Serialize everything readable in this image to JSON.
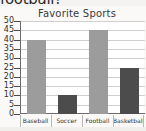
{
  "page": {
    "cut_off_text_above": "football?"
  },
  "chart_data": {
    "type": "bar",
    "title": "Favorite Sports",
    "xlabel": "",
    "ylabel": "",
    "categories": [
      "Baseball",
      "Soccer",
      "Football",
      "Basketball"
    ],
    "values": [
      40,
      10,
      45,
      25
    ],
    "bar_colors": [
      "#9c9c9c",
      "#4c4c4c",
      "#9c9c9c",
      "#4c4c4c"
    ],
    "ylim": [
      0,
      50
    ],
    "ytick_values": [
      0,
      5,
      10,
      15,
      20,
      25,
      30,
      35,
      40,
      45,
      50
    ],
    "ytick_labels": [
      "0",
      "5",
      "10",
      "15",
      "20",
      "25",
      "30",
      "35",
      "40",
      "45",
      "50"
    ],
    "grid": true,
    "legend": "none",
    "legend_position": "none"
  },
  "colors": {
    "bar_light": "#9c9c9c",
    "bar_dark": "#4c4c4c",
    "gridline": "#cfcfcf",
    "axis": "#6d6d6d",
    "plot_background": "#ffffff",
    "card_background": "#faf9f7",
    "text": "#333333"
  }
}
